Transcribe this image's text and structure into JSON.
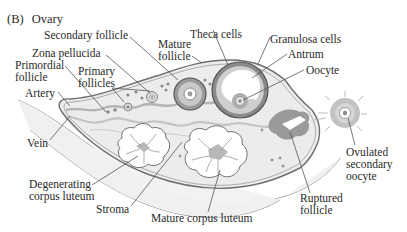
{
  "figure": {
    "panel_label": "(B)",
    "title": "Ovary"
  },
  "labels": {
    "secondary_follicle": "Secondary follicle",
    "theca_cells": "Theca cells",
    "mature_follicle": [
      "Mature",
      "follicle"
    ],
    "granulosa_cells": "Granulosa cells",
    "zona_pellucida": "Zona pellucida",
    "antrum": "Antrum",
    "primordial_follicle": [
      "Primordial",
      "follicle"
    ],
    "primary_follicles": [
      "Primary",
      "follicles"
    ],
    "oocyte": "Oocyte",
    "artery": "Artery",
    "vein": "Vein",
    "ovulated_secondary_oocyte": [
      "Ovulated",
      "secondary",
      "oocyte"
    ],
    "degenerating_corpus_luteum": [
      "Degenerating",
      "corpus luteum"
    ],
    "ruptured_follicle": [
      "Ruptured",
      "follicle"
    ],
    "stroma": "Stroma",
    "mature_corpus_luteum": "Mature corpus luteum"
  },
  "colors": {
    "outline": "#6f6f6f",
    "tissue_fill": "#ececec",
    "follicle_dark": "#8a8a8a",
    "vessel": "#b5b5b5",
    "text": "#2a2a2a",
    "leader": "#555555"
  }
}
